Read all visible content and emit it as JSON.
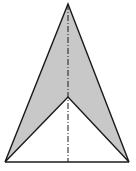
{
  "figure": {
    "colors": {
      "fill": "#c8c8c8",
      "stroke": "#1a1a1a",
      "background": "#ffffff"
    },
    "points": {
      "apex": [
        68,
        4
      ],
      "notch": [
        68,
        97
      ],
      "base_left": [
        5,
        162
      ],
      "base_right": [
        129,
        162
      ]
    },
    "axis": {
      "from": [
        68,
        4
      ],
      "to": [
        68,
        162
      ],
      "style": "dash-dot"
    }
  }
}
